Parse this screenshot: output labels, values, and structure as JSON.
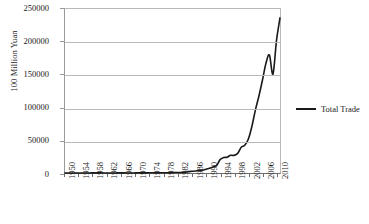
{
  "chart_data": {
    "type": "line",
    "title": "",
    "xlabel": "",
    "ylabel": "100 Million Yuan",
    "ylim": [
      0,
      250000
    ],
    "ytick_labels": [
      "250000",
      "200000",
      "150000",
      "100000",
      "50000",
      "0"
    ],
    "ytick_values": [
      250000,
      200000,
      150000,
      100000,
      50000,
      0
    ],
    "grid": true,
    "legend_position": "right",
    "legend": [
      "Total Trade"
    ],
    "xtick_labels": [
      "1950",
      "1954",
      "1958",
      "1962",
      "1966",
      "1970",
      "1974",
      "1978",
      "1982",
      "1986",
      "1990",
      "1994",
      "1998",
      "2002",
      "2006",
      "2010"
    ],
    "xtick_values": [
      1950,
      1954,
      1958,
      1962,
      1966,
      1970,
      1974,
      1978,
      1982,
      1986,
      1990,
      1994,
      1998,
      2002,
      2006,
      2010
    ],
    "xlim": [
      1950,
      2011
    ],
    "series": [
      {
        "name": "Total Trade",
        "color": "#1a1a1a",
        "x": [
          1950,
          1951,
          1952,
          1953,
          1954,
          1955,
          1956,
          1957,
          1958,
          1959,
          1960,
          1961,
          1962,
          1963,
          1964,
          1965,
          1966,
          1967,
          1968,
          1969,
          1970,
          1971,
          1972,
          1973,
          1974,
          1975,
          1976,
          1977,
          1978,
          1979,
          1980,
          1981,
          1982,
          1983,
          1984,
          1985,
          1986,
          1987,
          1988,
          1989,
          1990,
          1991,
          1992,
          1993,
          1994,
          1995,
          1996,
          1997,
          1998,
          1999,
          2000,
          2001,
          2002,
          2003,
          2004,
          2005,
          2006,
          2007,
          2008,
          2009,
          2010,
          2011
        ],
        "values": [
          41,
          59,
          65,
          81,
          85,
          110,
          109,
          105,
          129,
          149,
          128,
          91,
          81,
          86,
          98,
          118,
          127,
          113,
          108,
          107,
          113,
          121,
          147,
          221,
          292,
          291,
          265,
          273,
          355,
          455,
          570,
          735,
          771,
          860,
          1201,
          2067,
          2580,
          3084,
          3822,
          4156,
          5560,
          7226,
          9120,
          11271,
          20382,
          23500,
          24134,
          26967,
          26850,
          29896,
          39273,
          42184,
          51378,
          70484,
          95539,
          116922,
          140974,
          166864,
          179921,
          150648,
          201722,
          236402
        ],
        "peak_2008": 179921,
        "dip_2009": 150648,
        "end_2011": 236402
      }
    ]
  },
  "legend": {
    "entries": [
      {
        "label": "Total Trade",
        "color": "#1a1a1a"
      }
    ]
  },
  "axis": {
    "y_title": "100 Million Yuan"
  }
}
